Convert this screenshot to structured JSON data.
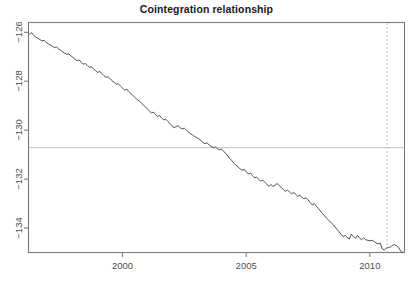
{
  "chart_data": {
    "type": "line",
    "title": "Cointegration relationship",
    "xlabel": "",
    "ylabel": "",
    "grid": false,
    "legend": "none",
    "xlim": [
      1996.2,
      2011.4
    ],
    "ylim": [
      -135.0,
      -125.6
    ],
    "xticks": [
      2000,
      2005,
      2010
    ],
    "xtick_labels": [
      "2000",
      "2005",
      "2010"
    ],
    "yticks": [
      -126,
      -128,
      -130,
      -132,
      -134
    ],
    "ytick_labels": [
      "-126",
      "-128",
      "-130",
      "-132",
      "-134"
    ],
    "series": [
      {
        "name": "cointegration residual",
        "color": "#3d3d3d",
        "x": [
          1996.25,
          1996.33,
          1996.42,
          1996.5,
          1996.58,
          1996.67,
          1996.75,
          1996.83,
          1996.92,
          1997.0,
          1997.08,
          1997.17,
          1997.25,
          1997.33,
          1997.42,
          1997.5,
          1997.58,
          1997.67,
          1997.75,
          1997.83,
          1997.92,
          1998.0,
          1998.08,
          1998.17,
          1998.25,
          1998.33,
          1998.42,
          1998.5,
          1998.58,
          1998.67,
          1998.75,
          1998.83,
          1998.92,
          1999.0,
          1999.08,
          1999.17,
          1999.25,
          1999.33,
          1999.42,
          1999.5,
          1999.58,
          1999.67,
          1999.75,
          1999.83,
          1999.92,
          2000.0,
          2000.08,
          2000.17,
          2000.25,
          2000.33,
          2000.42,
          2000.5,
          2000.58,
          2000.67,
          2000.75,
          2000.83,
          2000.92,
          2001.0,
          2001.08,
          2001.17,
          2001.25,
          2001.33,
          2001.42,
          2001.5,
          2001.58,
          2001.67,
          2001.75,
          2001.83,
          2001.92,
          2002.0,
          2002.08,
          2002.17,
          2002.25,
          2002.33,
          2002.42,
          2002.5,
          2002.58,
          2002.67,
          2002.75,
          2002.83,
          2002.92,
          2003.0,
          2003.08,
          2003.17,
          2003.25,
          2003.33,
          2003.42,
          2003.5,
          2003.58,
          2003.67,
          2003.75,
          2003.83,
          2003.92,
          2004.0,
          2004.08,
          2004.17,
          2004.25,
          2004.33,
          2004.42,
          2004.5,
          2004.58,
          2004.67,
          2004.75,
          2004.83,
          2004.92,
          2005.0,
          2005.08,
          2005.17,
          2005.25,
          2005.33,
          2005.42,
          2005.5,
          2005.58,
          2005.67,
          2005.75,
          2005.83,
          2005.92,
          2006.0,
          2006.08,
          2006.17,
          2006.25,
          2006.33,
          2006.42,
          2006.5,
          2006.58,
          2006.67,
          2006.75,
          2006.83,
          2006.92,
          2007.0,
          2007.08,
          2007.17,
          2007.25,
          2007.33,
          2007.42,
          2007.5,
          2007.58,
          2007.67,
          2007.75,
          2007.83,
          2007.92,
          2008.0,
          2008.08,
          2008.17,
          2008.25,
          2008.33,
          2008.42,
          2008.5,
          2008.58,
          2008.67,
          2008.75,
          2008.83,
          2008.92,
          2009.0,
          2009.08,
          2009.17,
          2009.25,
          2009.33,
          2009.42,
          2009.5,
          2009.58,
          2009.67,
          2009.75,
          2009.83,
          2009.92,
          2010.0,
          2010.08,
          2010.17,
          2010.25,
          2010.33,
          2010.42,
          2010.5,
          2010.58,
          2010.67,
          2010.75,
          2010.83,
          2010.92,
          2011.0,
          2011.08,
          2011.17,
          2011.25,
          2011.33
        ],
        "y": [
          -126.08,
          -126.02,
          -126.14,
          -126.2,
          -126.25,
          -126.3,
          -126.35,
          -126.33,
          -126.42,
          -126.47,
          -126.52,
          -126.57,
          -126.63,
          -126.6,
          -126.68,
          -126.74,
          -126.8,
          -126.86,
          -126.9,
          -126.88,
          -126.97,
          -127.03,
          -127.1,
          -127.16,
          -127.13,
          -127.22,
          -127.3,
          -127.28,
          -127.36,
          -127.43,
          -127.41,
          -127.5,
          -127.57,
          -127.64,
          -127.6,
          -127.69,
          -127.77,
          -127.84,
          -127.82,
          -127.9,
          -127.98,
          -128.05,
          -128.12,
          -128.1,
          -128.2,
          -128.28,
          -128.36,
          -128.32,
          -128.42,
          -128.5,
          -128.58,
          -128.66,
          -128.74,
          -128.8,
          -128.88,
          -128.96,
          -129.05,
          -129.12,
          -129.2,
          -129.3,
          -129.26,
          -129.36,
          -129.44,
          -129.4,
          -129.5,
          -129.58,
          -129.55,
          -129.64,
          -129.73,
          -129.82,
          -129.9,
          -129.85,
          -129.82,
          -129.9,
          -129.95,
          -129.92,
          -130.0,
          -130.08,
          -130.15,
          -130.2,
          -130.26,
          -130.3,
          -130.35,
          -130.42,
          -130.5,
          -130.55,
          -130.52,
          -130.6,
          -130.66,
          -130.72,
          -130.68,
          -130.75,
          -130.8,
          -130.78,
          -130.85,
          -130.95,
          -131.05,
          -131.15,
          -131.25,
          -131.35,
          -131.42,
          -131.5,
          -131.58,
          -131.64,
          -131.6,
          -131.7,
          -131.78,
          -131.75,
          -131.85,
          -131.95,
          -131.92,
          -132.0,
          -132.08,
          -132.04,
          -132.12,
          -132.2,
          -132.3,
          -132.22,
          -132.3,
          -132.25,
          -132.18,
          -132.26,
          -132.34,
          -132.42,
          -132.5,
          -132.45,
          -132.52,
          -132.6,
          -132.55,
          -132.62,
          -132.7,
          -132.66,
          -132.74,
          -132.8,
          -132.76,
          -132.85,
          -132.95,
          -133.05,
          -133.0,
          -133.1,
          -133.2,
          -133.3,
          -133.4,
          -133.5,
          -133.6,
          -133.68,
          -133.76,
          -133.85,
          -133.95,
          -134.05,
          -134.15,
          -134.25,
          -134.35,
          -134.3,
          -134.38,
          -134.45,
          -134.25,
          -134.35,
          -134.42,
          -134.3,
          -134.4,
          -134.48,
          -134.4,
          -134.48,
          -134.5,
          -134.52,
          -134.5,
          -134.55,
          -134.6,
          -134.65,
          -134.62,
          -134.85,
          -134.9,
          -134.82,
          -134.8,
          -134.78,
          -134.7,
          -134.68,
          -134.72,
          -134.8,
          -134.95,
          -135.0
        ]
      }
    ],
    "reference_lines": [
      {
        "name": "mean-level-line",
        "orientation": "horizontal",
        "value": -130.71,
        "style": "solid",
        "color": "#cdcdcd"
      },
      {
        "name": "break-date-line",
        "orientation": "vertical",
        "value": 2010.7,
        "style": "dashed",
        "color": "#cccccc"
      }
    ],
    "axis_color": "#7a7a7a",
    "box_color": "#7a7a7a"
  }
}
